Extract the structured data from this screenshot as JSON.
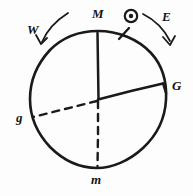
{
  "diagram": {
    "background_color": "#fdfdfd",
    "ink_color": "#1a1a1a",
    "circle": {
      "center_x": 98,
      "center_y": 99,
      "radius": 68
    },
    "labels": {
      "top": "M",
      "bottom": "m",
      "right": "G",
      "left": "g",
      "west": "W",
      "east": "E"
    },
    "radii": [
      {
        "name": "center-to-M",
        "style": "solid",
        "to_label": "M"
      },
      {
        "name": "center-to-G",
        "style": "solid",
        "to_label": "G"
      },
      {
        "name": "center-to-m",
        "style": "dashed",
        "to_label": "m"
      },
      {
        "name": "center-to-g",
        "style": "dashed",
        "to_label": "g"
      }
    ],
    "markers": {
      "sun_symbol": "circle-with-dot",
      "sun_x": 131,
      "sun_y": 16,
      "arc_tick_x": 124,
      "arc_tick_y": 33
    },
    "arrows": [
      {
        "name": "west-arrow",
        "direction": "down-left",
        "label": "W"
      },
      {
        "name": "east-arrow",
        "direction": "down-right",
        "label": "E"
      }
    ]
  }
}
